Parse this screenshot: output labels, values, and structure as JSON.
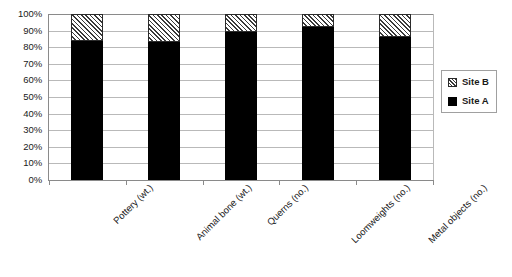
{
  "chart_data": {
    "type": "bar",
    "title": "",
    "xlabel": "",
    "ylabel": "",
    "stacked": true,
    "grid": true,
    "legend_position": "right",
    "ylim": [
      0,
      100
    ],
    "ytick_labels": [
      "100%",
      "90%",
      "80%",
      "70%",
      "60%",
      "50%",
      "40%",
      "30%",
      "20%",
      "10%",
      "0%"
    ],
    "ytick_values": [
      100,
      90,
      80,
      70,
      60,
      50,
      40,
      30,
      20,
      10,
      0
    ],
    "categories": [
      "Pottery (wt.)",
      "Animal bone (wt.)",
      "Querns (no.)",
      "Loomweights (no.)",
      "Metal objects (no.)"
    ],
    "series": [
      {
        "name": "Site A",
        "fill": "solid-black",
        "color": "#000000",
        "values": [
          84,
          83,
          89,
          92,
          86
        ]
      },
      {
        "name": "Site B",
        "fill": "diagonal-hatch",
        "color": "#ffffff",
        "values": [
          16,
          17,
          11,
          8,
          14
        ]
      }
    ]
  },
  "legend": {
    "items": [
      {
        "label": "Site B",
        "swatch": "hatch-swatch"
      },
      {
        "label": "Site A",
        "swatch": "solid-swatch"
      }
    ]
  }
}
